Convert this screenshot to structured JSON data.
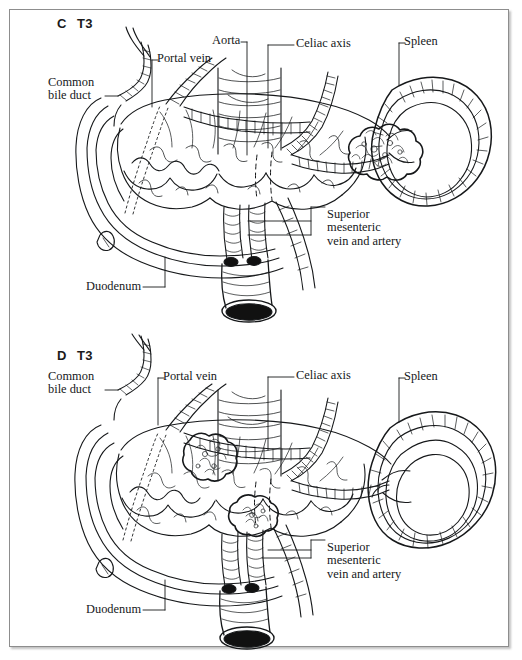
{
  "figure": {
    "background_color": "#ffffff",
    "ink_color": "#16181a",
    "frame_color": "#8d8d8d"
  },
  "panels": [
    {
      "id": "C",
      "panel_letter": "C",
      "stage": "T3",
      "labels": [
        {
          "name": "common-bile-duct",
          "text": "Common\nbile duct"
        },
        {
          "name": "portal-vein",
          "text": "Portal vein"
        },
        {
          "name": "aorta",
          "text": "Aorta"
        },
        {
          "name": "celiac-axis",
          "text": "Celiac axis"
        },
        {
          "name": "spleen",
          "text": "Spleen"
        },
        {
          "name": "superior-mesenteric-vein-and-artery",
          "text": "Superior\nmesenteric\nvein and artery"
        },
        {
          "name": "duodenum",
          "text": "Duodenum"
        }
      ],
      "tumors": 1,
      "tumor_locations": [
        "pancreatic tail adjacent to splenic hilum"
      ]
    },
    {
      "id": "D",
      "panel_letter": "D",
      "stage": "T3",
      "labels": [
        {
          "name": "common-bile-duct",
          "text": "Common\nbile duct"
        },
        {
          "name": "portal-vein",
          "text": "Portal vein"
        },
        {
          "name": "celiac-axis",
          "text": "Celiac axis"
        },
        {
          "name": "spleen",
          "text": "Spleen"
        },
        {
          "name": "superior-mesenteric-vein-and-artery",
          "text": "Superior\nmesenteric\nvein and artery"
        },
        {
          "name": "duodenum",
          "text": "Duodenum"
        }
      ],
      "tumors": 2,
      "tumor_locations": [
        "pancreatic neck anterior",
        "pancreatic uncinate near SMV"
      ]
    }
  ]
}
